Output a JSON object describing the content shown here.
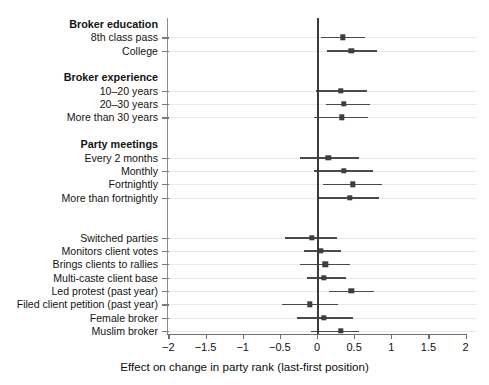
{
  "chart_data": {
    "type": "scatter",
    "subtype": "coefficient-forest-plot",
    "title": "",
    "xlabel": "Effect on change in party rank (last-first position)",
    "ylabel": "",
    "xlim": [
      -2,
      2
    ],
    "xticks": [
      -2,
      -1.5,
      -1,
      -0.5,
      0,
      0.5,
      1,
      1.5,
      2
    ],
    "xticklabels": [
      "−2",
      "−1.5",
      "−1",
      "−0.5",
      "0",
      "0.5",
      "1",
      "1.5",
      "2"
    ],
    "grid": true,
    "legend": "none",
    "reference_line": 0,
    "rows": [
      {
        "label": "Broker education",
        "type": "group"
      },
      {
        "label": "8th class pass",
        "type": "estimate",
        "estimate": 0.35,
        "ci_low": 0.06,
        "ci_high": 0.64
      },
      {
        "label": "College",
        "type": "estimate",
        "estimate": 0.46,
        "ci_low": 0.13,
        "ci_high": 0.81
      },
      {
        "label": "",
        "type": "spacer"
      },
      {
        "label": "Broker experience",
        "type": "group"
      },
      {
        "label": "10–20 years",
        "type": "estimate",
        "estimate": 0.32,
        "ci_low": -0.01,
        "ci_high": 0.67
      },
      {
        "label": "20–30 years",
        "type": "estimate",
        "estimate": 0.36,
        "ci_low": 0.12,
        "ci_high": 0.72
      },
      {
        "label": "More than 30 years",
        "type": "estimate",
        "estimate": 0.33,
        "ci_low": -0.04,
        "ci_high": 0.69
      },
      {
        "label": "",
        "type": "spacer"
      },
      {
        "label": "Party meetings",
        "type": "group"
      },
      {
        "label": "Every 2 months",
        "type": "estimate",
        "estimate": 0.15,
        "ci_low": -0.23,
        "ci_high": 0.56
      },
      {
        "label": "Monthly",
        "type": "estimate",
        "estimate": 0.36,
        "ci_low": -0.04,
        "ci_high": 0.76
      },
      {
        "label": "Fortnightly",
        "type": "estimate",
        "estimate": 0.48,
        "ci_low": 0.08,
        "ci_high": 0.88
      },
      {
        "label": "More than fortnightly",
        "type": "estimate",
        "estimate": 0.44,
        "ci_low": 0.03,
        "ci_high": 0.84
      },
      {
        "label": "",
        "type": "spacer"
      },
      {
        "label": "",
        "type": "spacer"
      },
      {
        "label": "Switched parties",
        "type": "estimate",
        "estimate": -0.07,
        "ci_low": -0.43,
        "ci_high": 0.27
      },
      {
        "label": "Monitors client votes",
        "type": "estimate",
        "estimate": 0.05,
        "ci_low": -0.18,
        "ci_high": 0.32
      },
      {
        "label": "Brings clients to rallies",
        "type": "estimate",
        "estimate": 0.11,
        "ci_low": -0.23,
        "ci_high": 0.44
      },
      {
        "label": "Multi-caste client base",
        "type": "estimate",
        "estimate": 0.09,
        "ci_low": -0.14,
        "ci_high": 0.39
      },
      {
        "label": "Led protest (past year)",
        "type": "estimate",
        "estimate": 0.46,
        "ci_low": 0.16,
        "ci_high": 0.77
      },
      {
        "label": "Filed client petition (past year)",
        "type": "estimate",
        "estimate": -0.1,
        "ci_low": -0.47,
        "ci_high": 0.28
      },
      {
        "label": "Female broker",
        "type": "estimate",
        "estimate": 0.09,
        "ci_low": -0.27,
        "ci_high": 0.48
      },
      {
        "label": "Muslim broker",
        "type": "estimate",
        "estimate": 0.32,
        "ci_low": -0.08,
        "ci_high": 0.57
      }
    ],
    "colors": {
      "marker": "#3d3d3d",
      "ci": "#4a4a4a",
      "zero_line": "#3a3a3a",
      "grid": "#e9e9e9",
      "axis": "#6f6f6f",
      "text": "#111111"
    }
  }
}
